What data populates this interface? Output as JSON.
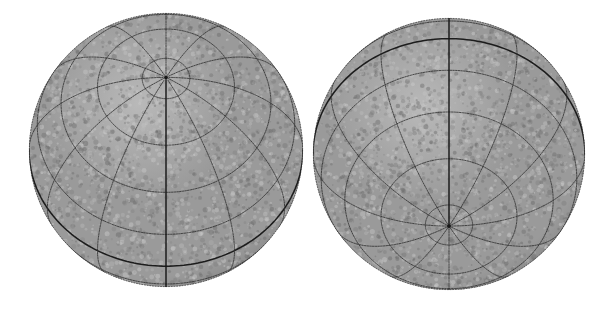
{
  "figure": {
    "background_color": "#ffffff",
    "width": 614,
    "height": 309,
    "sphere_fill_color": "#9a9a9a",
    "sphere_shade_dark": "#7d7d7d",
    "sphere_shade_light": "#b9b9b9",
    "graticule_color": "#2e2e2e",
    "graticule_major_color": "#171717",
    "texture": {
      "name": "mottled-speckle",
      "description": "grainy mottled grey surface texture",
      "speckle_light": "#c9c9c9",
      "speckle_dark": "#6d6d6d",
      "density": 2600
    }
  },
  "globes": [
    {
      "id": "globe-left",
      "label": "North polar oblique view",
      "center_x": 166,
      "center_y": 150,
      "radius": 137,
      "pole_shown": "north",
      "view_latitude_deg": 58,
      "view_longitude_deg": 0,
      "graticule": {
        "meridian_step_deg": 30,
        "parallel_step_deg": 20,
        "meridian_count": 12,
        "parallel_count": 8,
        "equator_visible": true,
        "central_meridian_visible": true
      }
    },
    {
      "id": "globe-right",
      "label": "South polar oblique view",
      "center_x": 449,
      "center_y": 154,
      "radius": 136,
      "pole_shown": "south",
      "view_latitude_deg": -58,
      "view_longitude_deg": 0,
      "graticule": {
        "meridian_step_deg": 30,
        "parallel_step_deg": 20,
        "meridian_count": 12,
        "parallel_count": 8,
        "equator_visible": true,
        "central_meridian_visible": true
      }
    }
  ]
}
